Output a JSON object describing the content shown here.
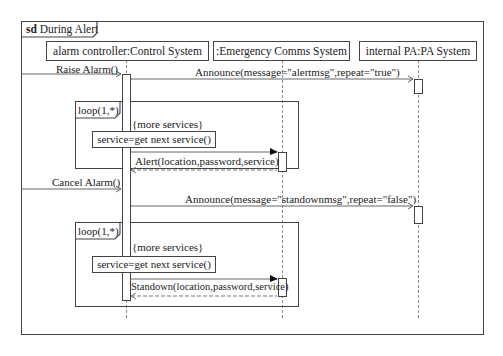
{
  "diagram": {
    "type": "UML sequence diagram",
    "frame": {
      "keyword": "sd",
      "name": "During Alert"
    },
    "lifelines": [
      {
        "id": "controller",
        "label": "alarm controller:Control System"
      },
      {
        "id": "comms",
        "label": ":Emergency Comms System"
      },
      {
        "id": "pa",
        "label": "internal PA:PA System"
      }
    ],
    "messages": [
      {
        "from": "external",
        "to": "controller",
        "label": "Raise Alarm()",
        "style": "open-arrow"
      },
      {
        "from": "controller",
        "to": "pa",
        "label": "Announce(message=\"alertmsg\",repeat=\"true\")",
        "style": "open-arrow"
      },
      {
        "from": "controller",
        "to": "comms",
        "label": "Alert(location,password,service)",
        "style": "filled-arrow"
      },
      {
        "from": "comms",
        "to": "controller",
        "label": "",
        "style": "dashed-return"
      },
      {
        "from": "external",
        "to": "controller",
        "label": "Cancel Alarm()",
        "style": "open-arrow"
      },
      {
        "from": "controller",
        "to": "pa",
        "label": "Announce(message=\"standownmsg\",repeat=\"false\")",
        "style": "open-arrow"
      },
      {
        "from": "controller",
        "to": "comms",
        "label": "Standown(location,password,service)",
        "style": "filled-arrow"
      },
      {
        "from": "comms",
        "to": "controller",
        "label": "",
        "style": "dashed-return"
      }
    ],
    "fragments": [
      {
        "operator": "loop(1,*)",
        "guard": "{more services}",
        "action": "service=get next service()",
        "message_label": "Alert(location,password,service)"
      },
      {
        "operator": "loop(1,*)",
        "guard": "{more services}",
        "action": "service=get next service()",
        "message_label": "Standown(location,password,service)"
      }
    ]
  }
}
